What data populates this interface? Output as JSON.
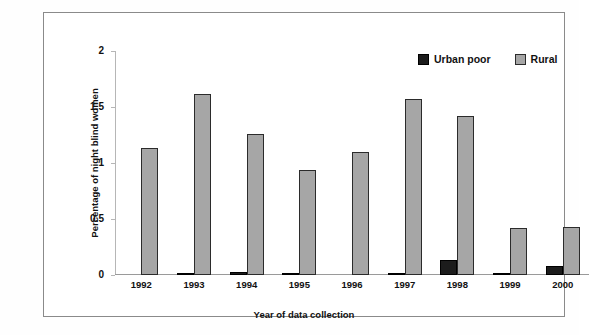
{
  "chart_data": {
    "type": "bar",
    "title": "",
    "xlabel": "Year of data collection",
    "ylabel": "Percentage of night blind women",
    "categories": [
      "1992",
      "1993",
      "1994",
      "1995",
      "1996",
      "1997",
      "1998",
      "1999",
      "2000"
    ],
    "series": [
      {
        "name": "Urban poor",
        "color": "#1c1c1c",
        "values": [
          0,
          0.02,
          0.03,
          0.005,
          0,
          0.02,
          0.13,
          0.01,
          0.08
        ]
      },
      {
        "name": "Rural",
        "color": "#a6a6a6",
        "values": [
          1.13,
          1.62,
          1.26,
          0.94,
          1.1,
          1.57,
          1.42,
          0.42,
          0.43
        ]
      }
    ],
    "ylim": [
      0,
      2
    ],
    "yticks": [
      "0",
      "0.5",
      "1",
      "1.5",
      "2"
    ],
    "ytick_values": [
      0,
      0.5,
      1,
      1.5,
      2
    ],
    "grid": false,
    "legend_position": "top-right",
    "legend": [
      "Urban poor",
      "Rural"
    ]
  }
}
